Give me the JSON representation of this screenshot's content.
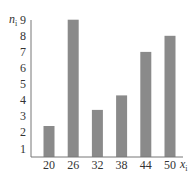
{
  "chart_data": {
    "type": "bar",
    "title": "",
    "xlabel": "x",
    "xlabel_subscript": "i",
    "ylabel": "n",
    "ylabel_subscript": "i",
    "categories": [
      "20",
      "26",
      "32",
      "38",
      "44",
      "50"
    ],
    "values": [
      2.4,
      9,
      3.4,
      4.3,
      7,
      8
    ],
    "yticks": [
      "1",
      "2",
      "3",
      "4",
      "5",
      "6",
      "7",
      "8",
      "9"
    ],
    "ylim": [
      0,
      9
    ],
    "grid": false,
    "legend": "none",
    "bar_color": "#8a8a8a",
    "axis_color": "#777777"
  }
}
